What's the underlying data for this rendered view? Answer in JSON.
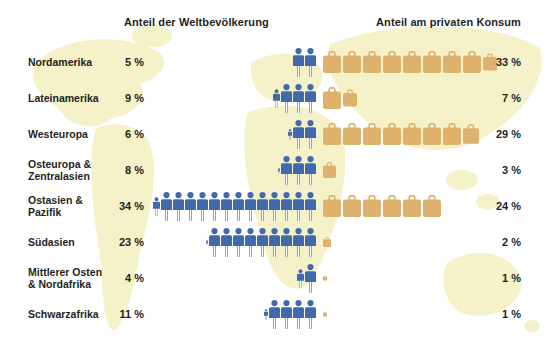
{
  "header": {
    "population": "Anteil der Weltbevölkerung",
    "consumption": "Anteil am privaten Konsum"
  },
  "colors": {
    "person": "#4169ae",
    "suitcase": "#deb26d",
    "map": "#f5f1c8",
    "text": "#1f1f1d",
    "background": "#ffffff"
  },
  "chart_data": {
    "type": "bar",
    "variant": "pictogram-isotype",
    "title": "",
    "categories": [
      "Nordamerika",
      "Lateinamerika",
      "Westeuropa",
      "Osteuropa &\nZentralasien",
      "Ostasien & Pazifik",
      "Südasien",
      "Mittlerer Osten\n& Nordafrika",
      "Schwarzafrika"
    ],
    "value_suffix": " %",
    "series": [
      {
        "name": "Anteil der Weltbevölkerung",
        "icon": "person",
        "color": "#4169ae",
        "unit_pct_per_icon": 2.5,
        "values": [
          5,
          9,
          6,
          8,
          34,
          23,
          4,
          11
        ],
        "icons": [
          2,
          3.6,
          2.4,
          3.2,
          13.6,
          9.2,
          1.6,
          4.4
        ],
        "alignment": "right"
      },
      {
        "name": "Anteil am privaten Konsum",
        "icon": "suitcase",
        "color": "#deb26d",
        "unit_pct_per_icon": 4,
        "values": [
          33,
          7,
          29,
          3,
          24,
          2,
          1,
          1
        ],
        "icons": [
          8.8,
          1.8,
          7.9,
          0.7,
          6,
          0.45,
          0.22,
          0.22
        ],
        "alignment": "left"
      }
    ],
    "legend_position": "none",
    "grid": false,
    "background_map": "world-map-pale-yellow"
  }
}
